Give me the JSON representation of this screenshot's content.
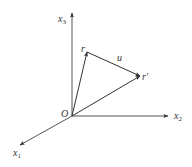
{
  "diagram": {
    "origin": {
      "label": "O",
      "x": 72,
      "y": 116
    },
    "axes": [
      {
        "name": "x1",
        "label": "x",
        "subscript": "1",
        "tip": {
          "x": 20,
          "y": 145
        }
      },
      {
        "name": "x2",
        "label": "x",
        "subscript": "2",
        "tip": {
          "x": 168,
          "y": 116
        }
      },
      {
        "name": "x3",
        "label": "x",
        "subscript": "3",
        "tip": {
          "x": 72,
          "y": 13
        }
      }
    ],
    "vectors": [
      {
        "name": "r",
        "label": "r",
        "from": "O",
        "to": {
          "x": 87,
          "y": 52
        }
      },
      {
        "name": "r_prime",
        "label": "r′",
        "from": "O",
        "to": {
          "x": 140,
          "y": 76
        }
      },
      {
        "name": "u",
        "label": "u",
        "from": "r",
        "to": "r_prime"
      }
    ],
    "colors": {
      "stroke": "#333333",
      "axis": "#555555",
      "background": "#ffffff"
    }
  },
  "labels": {
    "origin": "O",
    "x1_main": "x",
    "x1_sub": "1",
    "x2_main": "x",
    "x2_sub": "2",
    "x3_main": "x",
    "x3_sub": "3",
    "r": "r",
    "r_prime": "r′",
    "u": "u"
  }
}
